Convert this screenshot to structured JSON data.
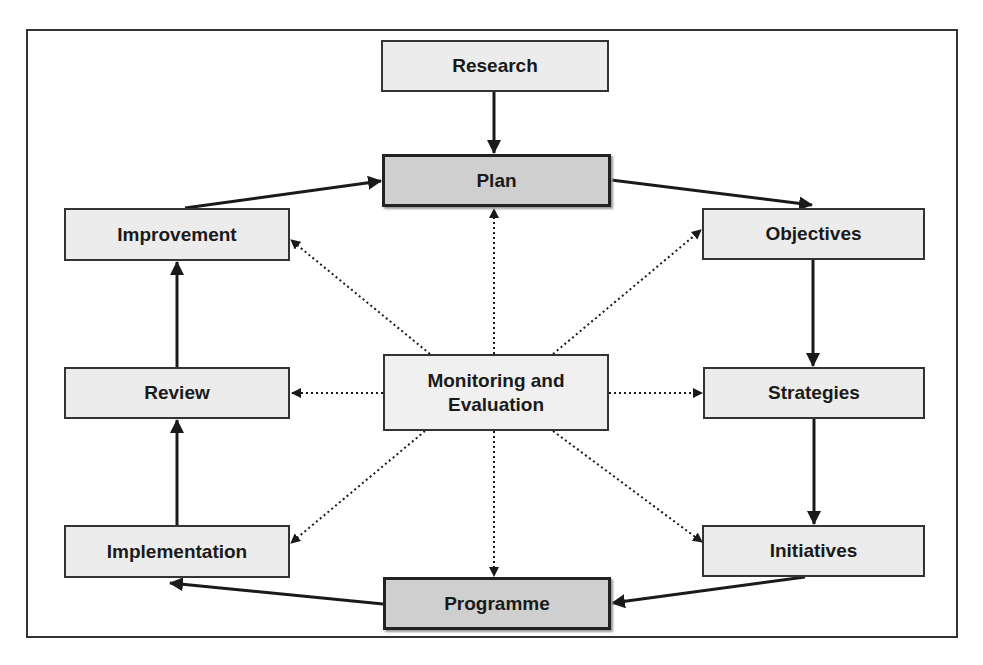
{
  "diagram": {
    "title": "",
    "colors": {
      "node_fill": "#ececec",
      "key_node_fill": "#cfcfcf",
      "border": "#333333",
      "background": "#ffffff"
    },
    "nodes": {
      "research": {
        "label": "Research",
        "x": 381,
        "y": 40,
        "w": 228,
        "h": 52,
        "style": "normal"
      },
      "plan": {
        "label": "Plan",
        "x": 382,
        "y": 154,
        "w": 229,
        "h": 53,
        "style": "key"
      },
      "improvement": {
        "label": "Improvement",
        "x": 64,
        "y": 208,
        "w": 226,
        "h": 53,
        "style": "normal"
      },
      "objectives": {
        "label": "Objectives",
        "x": 702,
        "y": 208,
        "w": 223,
        "h": 52,
        "style": "normal"
      },
      "review": {
        "label": "Review",
        "x": 64,
        "y": 367,
        "w": 226,
        "h": 52,
        "style": "normal"
      },
      "monitoring": {
        "label": "Monitoring and Evaluation",
        "x": 383,
        "y": 354,
        "w": 226,
        "h": 77,
        "style": "center"
      },
      "strategies": {
        "label": "Strategies",
        "x": 703,
        "y": 367,
        "w": 222,
        "h": 52,
        "style": "normal"
      },
      "implementation": {
        "label": "Implementation",
        "x": 64,
        "y": 525,
        "w": 226,
        "h": 53,
        "style": "normal"
      },
      "initiatives": {
        "label": "Initiatives",
        "x": 702,
        "y": 525,
        "w": 223,
        "h": 52,
        "style": "normal"
      },
      "programme": {
        "label": "Programme",
        "x": 383,
        "y": 577,
        "w": 228,
        "h": 53,
        "style": "key"
      }
    },
    "edges_solid": [
      {
        "from": "research",
        "to": "plan"
      },
      {
        "from": "plan",
        "to": "objectives"
      },
      {
        "from": "objectives",
        "to": "strategies"
      },
      {
        "from": "strategies",
        "to": "initiatives"
      },
      {
        "from": "initiatives",
        "to": "programme"
      },
      {
        "from": "programme",
        "to": "implementation"
      },
      {
        "from": "implementation",
        "to": "review"
      },
      {
        "from": "review",
        "to": "improvement"
      },
      {
        "from": "improvement",
        "to": "plan"
      }
    ],
    "edges_dotted": [
      {
        "from": "monitoring",
        "to": "plan"
      },
      {
        "from": "monitoring",
        "to": "improvement"
      },
      {
        "from": "monitoring",
        "to": "objectives"
      },
      {
        "from": "monitoring",
        "to": "review"
      },
      {
        "from": "monitoring",
        "to": "strategies"
      },
      {
        "from": "monitoring",
        "to": "implementation"
      },
      {
        "from": "monitoring",
        "to": "initiatives"
      },
      {
        "from": "monitoring",
        "to": "programme"
      }
    ]
  }
}
